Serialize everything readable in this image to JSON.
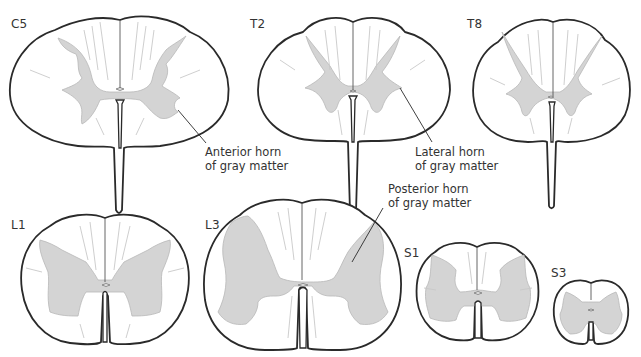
{
  "figure": {
    "colors": {
      "gray_matter": "#d4d4d4",
      "outline": "#2a2a2a",
      "background": "#ffffff",
      "text": "#333333"
    }
  },
  "sections": [
    {
      "id": "C5",
      "label": "C5"
    },
    {
      "id": "T2",
      "label": "T2"
    },
    {
      "id": "T8",
      "label": "T8"
    },
    {
      "id": "L1",
      "label": "L1"
    },
    {
      "id": "L3",
      "label": "L3"
    },
    {
      "id": "S1",
      "label": "S1"
    },
    {
      "id": "S3",
      "label": "S3"
    }
  ],
  "annotations": [
    {
      "id": "anterior-horn",
      "line1": "Anterior horn",
      "line2": "of gray matter",
      "points_to": "C5"
    },
    {
      "id": "lateral-horn",
      "line1": "Lateral horn",
      "line2": "of gray matter",
      "points_to": "T2"
    },
    {
      "id": "posterior-horn",
      "line1": "Posterior horn",
      "line2": "of gray matter",
      "points_to": "L3"
    }
  ]
}
